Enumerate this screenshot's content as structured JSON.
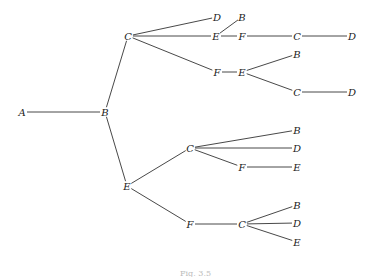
{
  "diagram": {
    "type": "tree",
    "nodes": [
      {
        "id": "n1",
        "label": "A",
        "x": 22,
        "y": 112
      },
      {
        "id": "n2",
        "label": "B",
        "x": 105,
        "y": 112
      },
      {
        "id": "n3",
        "label": "C",
        "x": 128,
        "y": 36
      },
      {
        "id": "n4",
        "label": "D",
        "x": 217,
        "y": 17
      },
      {
        "id": "n5",
        "label": "E",
        "x": 216,
        "y": 36
      },
      {
        "id": "n6",
        "label": "B",
        "x": 242,
        "y": 17
      },
      {
        "id": "n7",
        "label": "F",
        "x": 242,
        "y": 36
      },
      {
        "id": "n8",
        "label": "C",
        "x": 297,
        "y": 36
      },
      {
        "id": "n9",
        "label": "D",
        "x": 352,
        "y": 36
      },
      {
        "id": "n10",
        "label": "F",
        "x": 217,
        "y": 72
      },
      {
        "id": "n11",
        "label": "E",
        "x": 242,
        "y": 72
      },
      {
        "id": "n12",
        "label": "B",
        "x": 297,
        "y": 54
      },
      {
        "id": "n13",
        "label": "C",
        "x": 297,
        "y": 92
      },
      {
        "id": "n14",
        "label": "D",
        "x": 352,
        "y": 92
      },
      {
        "id": "n15",
        "label": "E",
        "x": 127,
        "y": 186
      },
      {
        "id": "n16",
        "label": "C",
        "x": 190,
        "y": 148
      },
      {
        "id": "n17",
        "label": "B",
        "x": 297,
        "y": 130
      },
      {
        "id": "n18",
        "label": "D",
        "x": 297,
        "y": 148
      },
      {
        "id": "n19",
        "label": "F",
        "x": 242,
        "y": 167
      },
      {
        "id": "n20",
        "label": "E",
        "x": 297,
        "y": 167
      },
      {
        "id": "n21",
        "label": "F",
        "x": 190,
        "y": 224
      },
      {
        "id": "n22",
        "label": "C",
        "x": 242,
        "y": 224
      },
      {
        "id": "n23",
        "label": "B",
        "x": 297,
        "y": 205
      },
      {
        "id": "n24",
        "label": "D",
        "x": 297,
        "y": 223
      },
      {
        "id": "n25",
        "label": "E",
        "x": 297,
        "y": 242
      }
    ],
    "edges": [
      [
        "n1",
        "n2"
      ],
      [
        "n2",
        "n3"
      ],
      [
        "n2",
        "n15"
      ],
      [
        "n3",
        "n4"
      ],
      [
        "n3",
        "n5"
      ],
      [
        "n3",
        "n10"
      ],
      [
        "n5",
        "n6"
      ],
      [
        "n5",
        "n7"
      ],
      [
        "n7",
        "n8"
      ],
      [
        "n8",
        "n9"
      ],
      [
        "n10",
        "n11"
      ],
      [
        "n11",
        "n12"
      ],
      [
        "n11",
        "n13"
      ],
      [
        "n13",
        "n14"
      ],
      [
        "n15",
        "n16"
      ],
      [
        "n15",
        "n21"
      ],
      [
        "n16",
        "n17"
      ],
      [
        "n16",
        "n18"
      ],
      [
        "n16",
        "n19"
      ],
      [
        "n19",
        "n20"
      ],
      [
        "n21",
        "n22"
      ],
      [
        "n22",
        "n23"
      ],
      [
        "n22",
        "n24"
      ],
      [
        "n22",
        "n25"
      ]
    ]
  },
  "caption": "Fig. 3.5"
}
